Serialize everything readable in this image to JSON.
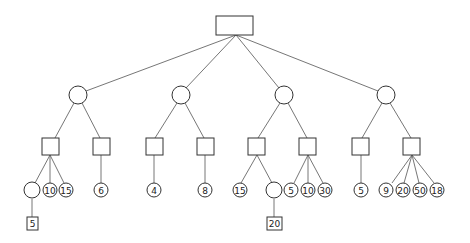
{
  "diagram": {
    "type": "game-tree",
    "colors": {
      "stroke": "#444444",
      "edge": "#666666",
      "background": "#ffffff"
    },
    "root": {
      "id": "root",
      "shape": "rect",
      "label": ""
    },
    "level1": [
      {
        "id": "c1",
        "shape": "circle",
        "label": ""
      },
      {
        "id": "c2",
        "shape": "circle",
        "label": ""
      },
      {
        "id": "c3",
        "shape": "circle",
        "label": ""
      },
      {
        "id": "c4",
        "shape": "circle",
        "label": ""
      }
    ],
    "level2": [
      {
        "id": "s1",
        "shape": "square",
        "label": "",
        "parent": "c1"
      },
      {
        "id": "s2",
        "shape": "square",
        "label": "",
        "parent": "c1"
      },
      {
        "id": "s3",
        "shape": "square",
        "label": "",
        "parent": "c2"
      },
      {
        "id": "s4",
        "shape": "square",
        "label": "",
        "parent": "c2"
      },
      {
        "id": "s5",
        "shape": "square",
        "label": "",
        "parent": "c3"
      },
      {
        "id": "s6",
        "shape": "square",
        "label": "",
        "parent": "c3"
      },
      {
        "id": "s7",
        "shape": "square",
        "label": "",
        "parent": "c4"
      },
      {
        "id": "s8",
        "shape": "square",
        "label": "",
        "parent": "c4"
      }
    ],
    "level3": [
      {
        "id": "l1",
        "shape": "circle",
        "label": "",
        "parent": "s1"
      },
      {
        "id": "l2",
        "shape": "circle",
        "label": "10",
        "parent": "s1"
      },
      {
        "id": "l3",
        "shape": "circle",
        "label": "15",
        "parent": "s1"
      },
      {
        "id": "l4",
        "shape": "circle",
        "label": "6",
        "parent": "s2"
      },
      {
        "id": "l5",
        "shape": "circle",
        "label": "4",
        "parent": "s3"
      },
      {
        "id": "l6",
        "shape": "circle",
        "label": "8",
        "parent": "s4"
      },
      {
        "id": "l7",
        "shape": "circle",
        "label": "15",
        "parent": "s5"
      },
      {
        "id": "l8",
        "shape": "circle",
        "label": "",
        "parent": "s5"
      },
      {
        "id": "l9",
        "shape": "circle",
        "label": "5",
        "parent": "s6"
      },
      {
        "id": "l10",
        "shape": "circle",
        "label": "10",
        "parent": "s6"
      },
      {
        "id": "l11",
        "shape": "circle",
        "label": "30",
        "parent": "s6"
      },
      {
        "id": "l12",
        "shape": "circle",
        "label": "5",
        "parent": "s7"
      },
      {
        "id": "l13",
        "shape": "circle",
        "label": "9",
        "parent": "s8"
      },
      {
        "id": "l14",
        "shape": "circle",
        "label": "20",
        "parent": "s8"
      },
      {
        "id": "l15",
        "shape": "circle",
        "label": "50",
        "parent": "s8"
      },
      {
        "id": "l16",
        "shape": "circle",
        "label": "18",
        "parent": "s8"
      }
    ],
    "level4": [
      {
        "id": "b1",
        "shape": "square",
        "label": "5",
        "parent": "l1"
      },
      {
        "id": "b2",
        "shape": "square",
        "label": "20",
        "parent": "l8"
      }
    ]
  }
}
